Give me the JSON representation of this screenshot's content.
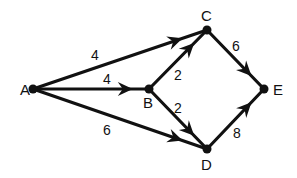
{
  "diagram": {
    "type": "directed-weighted-graph",
    "colors": {
      "stroke": "#111111",
      "text": "#111111",
      "background": "#ffffff"
    },
    "nodes": [
      {
        "id": "A",
        "label": "A",
        "x": 33,
        "y": 89,
        "lx": 20,
        "ly": 95
      },
      {
        "id": "B",
        "label": "B",
        "x": 149,
        "y": 89,
        "lx": 143,
        "ly": 108
      },
      {
        "id": "C",
        "label": "C",
        "x": 207,
        "y": 30,
        "lx": 201,
        "ly": 21
      },
      {
        "id": "D",
        "label": "D",
        "x": 207,
        "y": 149,
        "lx": 201,
        "ly": 170
      },
      {
        "id": "E",
        "label": "E",
        "x": 264,
        "y": 89,
        "lx": 273,
        "ly": 95
      }
    ],
    "edges": [
      {
        "from": "A",
        "to": "C",
        "weight": "4",
        "lx": 91,
        "ly": 60
      },
      {
        "from": "A",
        "to": "B",
        "weight": "4",
        "lx": 103,
        "ly": 84
      },
      {
        "from": "A",
        "to": "D",
        "weight": "6",
        "lx": 103,
        "ly": 135
      },
      {
        "from": "B",
        "to": "C",
        "weight": "2",
        "lx": 174,
        "ly": 80
      },
      {
        "from": "B",
        "to": "D",
        "weight": "2",
        "lx": 174,
        "ly": 113
      },
      {
        "from": "C",
        "to": "E",
        "weight": "6",
        "lx": 232,
        "ly": 51
      },
      {
        "from": "D",
        "to": "E",
        "weight": "8",
        "lx": 233,
        "ly": 138
      }
    ]
  }
}
